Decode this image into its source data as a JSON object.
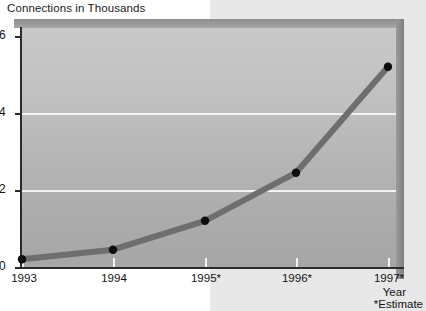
{
  "chart_data": {
    "type": "line",
    "title": "Connections in Thousands",
    "xlabel": "Year",
    "ylabel": "",
    "footnote": "*Estimate",
    "categories": [
      "1993",
      "1994",
      "1995*",
      "1996*",
      "1997*"
    ],
    "x": [
      1993,
      1994,
      1995,
      1996,
      1997
    ],
    "values": [
      0.2,
      0.45,
      1.2,
      2.45,
      5.2
    ],
    "series": [
      {
        "name": "Connections in Thousands",
        "values": [
          0.2,
          0.45,
          1.2,
          2.45,
          5.2
        ]
      }
    ],
    "ylim": [
      0,
      6
    ],
    "yticks": [
      0,
      2,
      4,
      6
    ],
    "ytick_labels": [
      "0",
      "2",
      "4",
      "6"
    ],
    "grid": true,
    "gridline_values": [
      2,
      4
    ],
    "legend": "none",
    "legend_position": "none",
    "marker": "circle",
    "marker_color": "#0d0d0d",
    "line_color": "#6e6e6e",
    "line_width": 6,
    "plot_background": "#bdbdbd",
    "gridline_color": "#f2f2f2",
    "axis_color": "#2b2b2b",
    "text_color": "#141414",
    "page_background": "#ffffff",
    "band_background": "#e8e8e8",
    "style": "3d-beveled-panel"
  },
  "title": {
    "text": "Connections in Thousands"
  },
  "y_axis": {
    "ticks": [
      {
        "label": "6",
        "value": 6
      },
      {
        "label": "4",
        "value": 4
      },
      {
        "label": "2",
        "value": 2
      },
      {
        "label": "0",
        "value": 0
      }
    ]
  },
  "x_axis": {
    "caption": "Year",
    "footnote": "*Estimate",
    "ticks": [
      {
        "label": "1993",
        "value": 0.2
      },
      {
        "label": "1994",
        "value": 0.45
      },
      {
        "label": "1995*",
        "value": 1.2
      },
      {
        "label": "1996*",
        "value": 2.45
      },
      {
        "label": "1997*",
        "value": 5.2
      }
    ]
  }
}
